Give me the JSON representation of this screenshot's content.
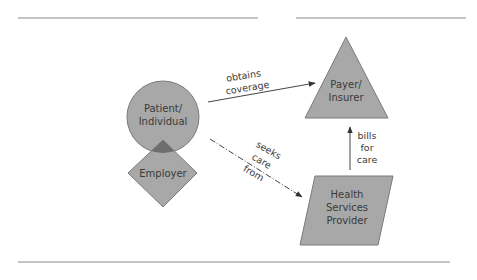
{
  "colors": {
    "shape_fill": "#a8a8a8",
    "shape_stroke": "#7a7a7a",
    "overlap_fill": "#6e6e6e",
    "line": "#444444",
    "rule": "#8a8a8a",
    "text": "#3a3a3a"
  },
  "nodes": {
    "patient": {
      "line1": "Patient/",
      "line2": "Individual",
      "shape": "circle"
    },
    "employer": {
      "line1": "Employer",
      "shape": "diamond"
    },
    "payer": {
      "line1": "Payer/",
      "line2": "Insurer",
      "shape": "triangle"
    },
    "provider": {
      "line1": "Health",
      "line2": "Services",
      "line3": "Provider",
      "shape": "parallelogram"
    }
  },
  "edges": {
    "coverage": {
      "from": "patient",
      "to": "payer",
      "line1": "obtains",
      "line2": "coverage",
      "style": "solid"
    },
    "care": {
      "from": "patient",
      "to": "provider",
      "line1": "seeks",
      "line2": "care",
      "line3": "from",
      "style": "dash-dot"
    },
    "bills": {
      "from": "provider",
      "to": "payer",
      "line1": "bills",
      "line2": "for",
      "line3": "care",
      "style": "solid"
    }
  }
}
